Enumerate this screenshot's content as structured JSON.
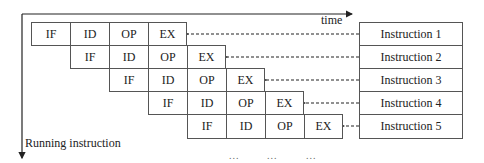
{
  "axes": {
    "time_label": "time",
    "running_label": "Running instruction"
  },
  "pipeline": {
    "stages": [
      "IF",
      "ID",
      "OP",
      "EX"
    ],
    "rows": [
      {
        "offset": 0,
        "cells": [
          "IF",
          "ID",
          "OP",
          "EX"
        ],
        "instruction": "Instruction 1"
      },
      {
        "offset": 1,
        "cells": [
          "IF",
          "ID",
          "OP",
          "EX"
        ],
        "instruction": "Instruction 2"
      },
      {
        "offset": 2,
        "cells": [
          "IF",
          "ID",
          "OP",
          "EX"
        ],
        "instruction": "Instruction 3"
      },
      {
        "offset": 3,
        "cells": [
          "IF",
          "ID",
          "OP",
          "EX"
        ],
        "instruction": "Instruction 4"
      },
      {
        "offset": 4,
        "cells": [
          "IF",
          "ID",
          "OP",
          "EX"
        ],
        "instruction": "Instruction 5"
      }
    ]
  },
  "continuation": [
    "...",
    "...",
    "..."
  ],
  "colors": {
    "line": "#333333",
    "border": "#555555",
    "text": "#222222"
  }
}
